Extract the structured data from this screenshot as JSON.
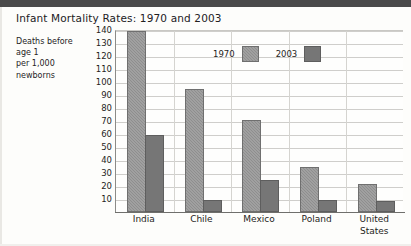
{
  "chart_data": {
    "type": "bar",
    "title": "Infant Mortality Rates: 1970 and 2003",
    "ylabel": "Deaths before age 1 per 1,000 newborns",
    "xlabel": "",
    "categories": [
      "India",
      "Chile",
      "Mexico",
      "Poland",
      "United States"
    ],
    "series": [
      {
        "name": "1970",
        "values": [
          138,
          93,
          69,
          33,
          20
        ],
        "color": "#8e8e8e"
      },
      {
        "name": "2003",
        "values": [
          58,
          8,
          23,
          8,
          7
        ],
        "color": "#767676"
      }
    ],
    "ylim": [
      0,
      140
    ],
    "yticks": [
      10,
      20,
      30,
      40,
      50,
      60,
      70,
      80,
      90,
      100,
      110,
      120,
      130,
      140
    ],
    "grid": "horizontal-and-vertical",
    "legend_position": "upper-center"
  },
  "caption": {
    "lines": [
      "Deaths before",
      "age 1",
      "per 1,000",
      "newborns"
    ]
  },
  "x_labels": [
    {
      "line1": "India",
      "line2": ""
    },
    {
      "line1": "Chile",
      "line2": ""
    },
    {
      "line1": "Mexico",
      "line2": ""
    },
    {
      "line1": "Poland",
      "line2": ""
    },
    {
      "line1": "United",
      "line2": "States"
    }
  ],
  "colors": {
    "series_1970": "#8e8e8e",
    "series_2003": "#767676",
    "gridline": "#cfcecb",
    "axis": "#6f6f6c",
    "top_bar": "#4a4a4a",
    "text": "#1f1d1b",
    "background": "#fdfdfb"
  }
}
